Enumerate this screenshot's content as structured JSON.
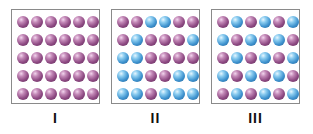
{
  "figure": {
    "colors": {
      "purple": "#8e4a83",
      "blue": "#3f93cf",
      "border": "#8a8a8a"
    },
    "panels": [
      {
        "label": "I",
        "rows": [
          [
            "purple",
            "purple",
            "purple",
            "purple",
            "purple",
            "purple"
          ],
          [
            "purple",
            "purple",
            "purple",
            "purple",
            "purple",
            "purple"
          ],
          [
            "purple",
            "purple",
            "purple",
            "purple",
            "purple",
            "purple"
          ],
          [
            "purple",
            "purple",
            "purple",
            "purple",
            "purple",
            "purple"
          ],
          [
            "purple",
            "purple",
            "purple",
            "purple",
            "purple",
            "purple"
          ]
        ]
      },
      {
        "label": "II",
        "rows": [
          [
            "purple",
            "purple",
            "blue",
            "blue",
            "purple",
            "purple"
          ],
          [
            "purple",
            "blue",
            "purple",
            "purple",
            "purple",
            "blue"
          ],
          [
            "blue",
            "blue",
            "purple",
            "purple",
            "purple",
            "purple"
          ],
          [
            "blue",
            "blue",
            "purple",
            "purple",
            "blue",
            "blue"
          ],
          [
            "blue",
            "blue",
            "purple",
            "blue",
            "blue",
            "blue"
          ]
        ]
      },
      {
        "label": "III",
        "rows": [
          [
            "purple",
            "blue",
            "purple",
            "blue",
            "purple",
            "blue"
          ],
          [
            "blue",
            "purple",
            "blue",
            "purple",
            "blue",
            "purple"
          ],
          [
            "purple",
            "blue",
            "purple",
            "blue",
            "purple",
            "blue"
          ],
          [
            "blue",
            "purple",
            "blue",
            "purple",
            "blue",
            "purple"
          ],
          [
            "purple",
            "blue",
            "purple",
            "blue",
            "purple",
            "blue"
          ]
        ]
      }
    ]
  }
}
